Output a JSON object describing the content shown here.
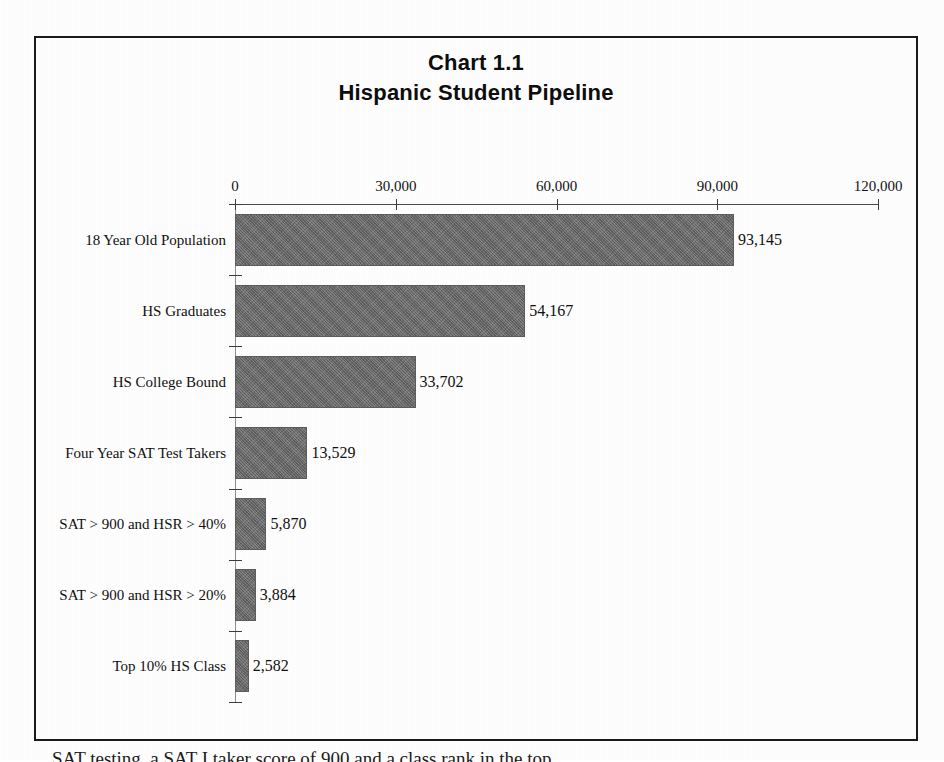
{
  "document": {
    "below_frame_text": "SAT testing, a SAT I taker score of 900 and a class rank in the top"
  },
  "chart": {
    "title_main": "Chart 1.1",
    "title_sub": "Hispanic Student Pipeline"
  },
  "chart_data": {
    "type": "bar",
    "orientation": "horizontal",
    "xlabel": "",
    "ylabel": "",
    "xlim": [
      0,
      120000
    ],
    "grid": false,
    "legend": null,
    "axis_position": "top",
    "tick_labels": [
      "0",
      "30,000",
      "60,000",
      "90,000",
      "120,000"
    ],
    "ticks": [
      0,
      30000,
      60000,
      90000,
      120000
    ],
    "bar_color": "#6c6c6c",
    "categories": [
      "18 Year Old Population",
      "HS Graduates",
      "HS College Bound",
      "Four Year SAT Test Takers",
      "SAT > 900 and HSR > 40%",
      "SAT > 900 and HSR > 20%",
      "Top 10% HS Class"
    ],
    "values": [
      93145,
      54167,
      33702,
      13529,
      5870,
      3884,
      2582
    ],
    "value_labels": [
      "93,145",
      "54,167",
      "33,702",
      "13,529",
      "5,870",
      "3,884",
      "2,582"
    ]
  }
}
